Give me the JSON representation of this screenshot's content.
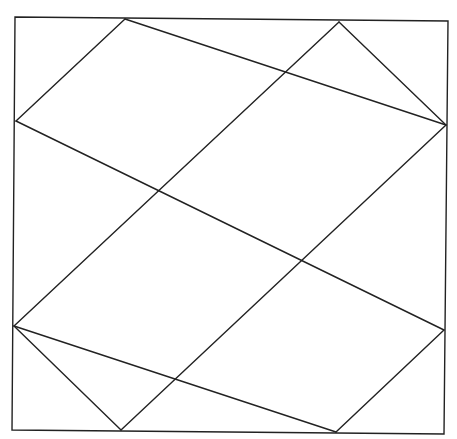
{
  "diagram": {
    "title": "",
    "background": "#ffffff",
    "stroke_color": "#222222",
    "stroke_width": 1.4,
    "frame": {
      "points": [
        [
          15,
          17
        ],
        [
          448,
          21
        ],
        [
          444,
          434
        ],
        [
          12,
          430
        ]
      ]
    },
    "lines": [
      {
        "name": "diag-down-1",
        "from": [
          125,
          19
        ],
        "to": [
          446,
          125
        ]
      },
      {
        "name": "diag-down-2",
        "from": [
          16,
          121
        ],
        "to": [
          444,
          330
        ]
      },
      {
        "name": "diag-down-3",
        "from": [
          14,
          326
        ],
        "to": [
          336,
          432
        ]
      },
      {
        "name": "diag-up-1",
        "from": [
          16,
          121
        ],
        "to": [
          125,
          19
        ]
      },
      {
        "name": "diag-up-2",
        "from": [
          14,
          326
        ],
        "to": [
          339,
          22
        ]
      },
      {
        "name": "diag-up-3",
        "from": [
          121,
          430
        ],
        "to": [
          446,
          125
        ]
      },
      {
        "name": "diag-up-4",
        "from": [
          336,
          432
        ],
        "to": [
          444,
          330
        ]
      },
      {
        "name": "diag-down-0",
        "from": [
          339,
          22
        ],
        "to": [
          446,
          125
        ]
      },
      {
        "name": "diag-down-4",
        "from": [
          14,
          326
        ],
        "to": [
          121,
          430
        ]
      }
    ],
    "vertices": {
      "top": [
        [
          125,
          19
        ],
        [
          339,
          22
        ]
      ],
      "left": [
        [
          16,
          121
        ],
        [
          14,
          326
        ]
      ],
      "right": [
        [
          446,
          125
        ],
        [
          444,
          330
        ]
      ],
      "bottom": [
        [
          121,
          430
        ],
        [
          336,
          432
        ]
      ],
      "interior": [
        [
          231,
          123
        ],
        [
          123,
          224
        ],
        [
          338,
          226
        ],
        [
          230,
          329
        ]
      ]
    }
  }
}
